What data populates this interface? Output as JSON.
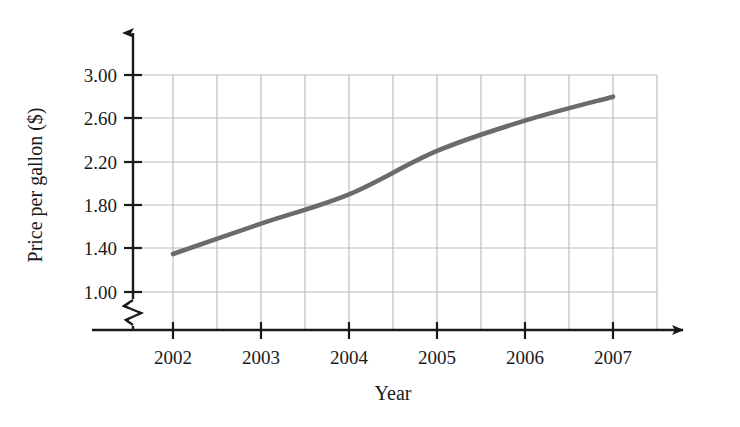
{
  "chart_data": {
    "type": "line",
    "title": "",
    "xlabel": "Year",
    "ylabel": "Price per gallon ($)",
    "x": [
      2002,
      2003,
      2004,
      2005,
      2006,
      2007
    ],
    "categories": [
      "2002",
      "2003",
      "2004",
      "2005",
      "2006",
      "2007"
    ],
    "values": [
      1.35,
      1.63,
      1.9,
      2.3,
      2.58,
      2.8
    ],
    "series": [
      {
        "name": "Price per gallon",
        "values": [
          1.35,
          1.63,
          1.9,
          2.3,
          2.58,
          2.8
        ]
      }
    ],
    "xlim": [
      2002,
      2007
    ],
    "ylim": [
      1.0,
      3.0
    ],
    "y_ticks": [
      1.0,
      1.4,
      1.8,
      2.2,
      2.6,
      3.0
    ],
    "y_tick_labels": [
      "1.00",
      "1.40",
      "1.80",
      "2.20",
      "2.60",
      "3.00"
    ],
    "x_ticks": [
      2002,
      2003,
      2004,
      2005,
      2006,
      2007
    ],
    "x_tick_labels": [
      "2002",
      "2003",
      "2004",
      "2005",
      "2006",
      "2007"
    ],
    "grid": true,
    "grid_minor_x": true,
    "legend": "none",
    "axis_break_y": true,
    "line_color": "#6b6b6b",
    "grid_color": "#b9b9b9",
    "axis_color": "#1a1a1a"
  },
  "axes": {
    "y_label": "Price per gallon ($)",
    "x_label": "Year",
    "y_tick_labels": [
      "3.00",
      "2.60",
      "2.20",
      "1.80",
      "1.40",
      "1.00"
    ],
    "x_tick_labels": [
      "2002",
      "2003",
      "2004",
      "2005",
      "2006",
      "2007"
    ]
  },
  "icons": {
    "y_axis_arrow": "arrow-up-icon",
    "x_axis_arrow": "arrow-right-icon",
    "axis_break": "axis-break-zigzag-icon"
  }
}
